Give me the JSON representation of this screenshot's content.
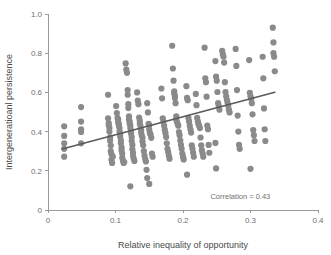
{
  "chart_data": {
    "type": "scatter",
    "title": "",
    "xlabel": "Relative inequality of opportunity",
    "ylabel": "Intergeneratioanl persistence",
    "xlim": [
      0,
      0.4
    ],
    "ylim": [
      0,
      1.0
    ],
    "xticks": [
      0,
      0.1,
      0.2,
      0.3,
      0.4
    ],
    "xtick_labels": [
      "0",
      "0.1",
      "0.2",
      "0.3",
      "0.4"
    ],
    "yticks": [
      0,
      0.2,
      0.4,
      0.6,
      0.8,
      1.0
    ],
    "ytick_labels": [
      "0",
      "0.2",
      "0.4",
      "0.6",
      "0.8",
      "1.0"
    ],
    "grid": false,
    "legend": "none",
    "annotations": [
      {
        "text": "Correlation = 0.43",
        "x": 0.285,
        "y": 0.055
      }
    ],
    "marker_color": "#8a8a8a",
    "marker_size": 3.1,
    "trend_line": {
      "color": "#5a5a5a",
      "x": [
        0.021,
        0.336
      ],
      "y": [
        0.311,
        0.601
      ]
    },
    "points": [
      [
        0.024,
        0.427
      ],
      [
        0.024,
        0.378
      ],
      [
        0.024,
        0.34
      ],
      [
        0.024,
        0.312
      ],
      [
        0.024,
        0.272
      ],
      [
        0.049,
        0.525
      ],
      [
        0.049,
        0.451
      ],
      [
        0.049,
        0.412
      ],
      [
        0.049,
        0.398
      ],
      [
        0.049,
        0.34
      ],
      [
        0.089,
        0.588
      ],
      [
        0.089,
        0.468
      ],
      [
        0.09,
        0.444
      ],
      [
        0.09,
        0.432
      ],
      [
        0.091,
        0.418
      ],
      [
        0.091,
        0.4
      ],
      [
        0.092,
        0.371
      ],
      [
        0.092,
        0.353
      ],
      [
        0.093,
        0.329
      ],
      [
        0.093,
        0.3
      ],
      [
        0.094,
        0.284
      ],
      [
        0.094,
        0.256
      ],
      [
        0.095,
        0.24
      ],
      [
        0.096,
        0.272
      ],
      [
        0.101,
        0.53
      ],
      [
        0.102,
        0.495
      ],
      [
        0.103,
        0.47
      ],
      [
        0.104,
        0.462
      ],
      [
        0.104,
        0.447
      ],
      [
        0.105,
        0.438
      ],
      [
        0.105,
        0.43
      ],
      [
        0.106,
        0.418
      ],
      [
        0.106,
        0.4
      ],
      [
        0.107,
        0.388
      ],
      [
        0.107,
        0.374
      ],
      [
        0.108,
        0.354
      ],
      [
        0.108,
        0.341
      ],
      [
        0.109,
        0.32
      ],
      [
        0.109,
        0.305
      ],
      [
        0.11,
        0.288
      ],
      [
        0.11,
        0.266
      ],
      [
        0.111,
        0.252
      ],
      [
        0.112,
        0.24
      ],
      [
        0.113,
        0.245
      ],
      [
        0.115,
        0.748
      ],
      [
        0.116,
        0.716
      ],
      [
        0.117,
        0.7
      ],
      [
        0.118,
        0.612
      ],
      [
        0.118,
        0.588
      ],
      [
        0.119,
        0.54
      ],
      [
        0.119,
        0.52
      ],
      [
        0.12,
        0.478
      ],
      [
        0.12,
        0.462
      ],
      [
        0.121,
        0.452
      ],
      [
        0.121,
        0.44
      ],
      [
        0.122,
        0.432
      ],
      [
        0.122,
        0.418
      ],
      [
        0.123,
        0.404
      ],
      [
        0.123,
        0.39
      ],
      [
        0.124,
        0.372
      ],
      [
        0.124,
        0.352
      ],
      [
        0.125,
        0.332
      ],
      [
        0.125,
        0.31
      ],
      [
        0.126,
        0.292
      ],
      [
        0.126,
        0.275
      ],
      [
        0.127,
        0.262
      ],
      [
        0.128,
        0.25
      ],
      [
        0.122,
        0.121
      ],
      [
        0.132,
        0.6
      ],
      [
        0.133,
        0.558
      ],
      [
        0.134,
        0.54
      ],
      [
        0.135,
        0.472
      ],
      [
        0.136,
        0.455
      ],
      [
        0.136,
        0.44
      ],
      [
        0.137,
        0.428
      ],
      [
        0.138,
        0.408
      ],
      [
        0.138,
        0.394
      ],
      [
        0.139,
        0.38
      ],
      [
        0.14,
        0.368
      ],
      [
        0.14,
        0.35
      ],
      [
        0.141,
        0.33
      ],
      [
        0.142,
        0.3
      ],
      [
        0.143,
        0.278
      ],
      [
        0.144,
        0.26
      ],
      [
        0.145,
        0.248
      ],
      [
        0.147,
        0.545
      ],
      [
        0.148,
        0.498
      ],
      [
        0.149,
        0.44
      ],
      [
        0.15,
        0.432
      ],
      [
        0.15,
        0.41
      ],
      [
        0.151,
        0.392
      ],
      [
        0.152,
        0.385
      ],
      [
        0.153,
        0.368
      ],
      [
        0.154,
        0.288
      ],
      [
        0.155,
        0.272
      ],
      [
        0.146,
        0.205
      ],
      [
        0.147,
        0.163
      ],
      [
        0.15,
        0.133
      ],
      [
        0.168,
        0.62
      ],
      [
        0.169,
        0.57
      ],
      [
        0.17,
        0.468
      ],
      [
        0.171,
        0.452
      ],
      [
        0.172,
        0.43
      ],
      [
        0.173,
        0.41
      ],
      [
        0.174,
        0.392
      ],
      [
        0.175,
        0.372
      ],
      [
        0.176,
        0.34
      ],
      [
        0.177,
        0.312
      ],
      [
        0.178,
        0.296
      ],
      [
        0.179,
        0.278
      ],
      [
        0.18,
        0.262
      ],
      [
        0.184,
        0.838
      ],
      [
        0.185,
        0.722
      ],
      [
        0.186,
        0.66
      ],
      [
        0.187,
        0.605
      ],
      [
        0.187,
        0.595
      ],
      [
        0.188,
        0.582
      ],
      [
        0.188,
        0.572
      ],
      [
        0.189,
        0.545
      ],
      [
        0.19,
        0.478
      ],
      [
        0.19,
        0.462
      ],
      [
        0.191,
        0.45
      ],
      [
        0.192,
        0.44
      ],
      [
        0.193,
        0.43
      ],
      [
        0.194,
        0.398
      ],
      [
        0.195,
        0.382
      ],
      [
        0.196,
        0.355
      ],
      [
        0.197,
        0.332
      ],
      [
        0.198,
        0.312
      ],
      [
        0.199,
        0.288
      ],
      [
        0.2,
        0.272
      ],
      [
        0.201,
        0.258
      ],
      [
        0.205,
        0.632
      ],
      [
        0.206,
        0.572
      ],
      [
        0.207,
        0.56
      ],
      [
        0.208,
        0.47
      ],
      [
        0.209,
        0.452
      ],
      [
        0.21,
        0.43
      ],
      [
        0.211,
        0.412
      ],
      [
        0.212,
        0.395
      ],
      [
        0.213,
        0.33
      ],
      [
        0.214,
        0.312
      ],
      [
        0.215,
        0.292
      ],
      [
        0.216,
        0.272
      ],
      [
        0.206,
        0.18
      ],
      [
        0.219,
        0.592
      ],
      [
        0.22,
        0.535
      ],
      [
        0.221,
        0.47
      ],
      [
        0.222,
        0.452
      ],
      [
        0.223,
        0.438
      ],
      [
        0.224,
        0.428
      ],
      [
        0.225,
        0.418
      ],
      [
        0.226,
        0.37
      ],
      [
        0.227,
        0.33
      ],
      [
        0.228,
        0.305
      ],
      [
        0.229,
        0.288
      ],
      [
        0.23,
        0.272
      ],
      [
        0.232,
        0.828
      ],
      [
        0.233,
        0.672
      ],
      [
        0.234,
        0.652
      ],
      [
        0.235,
        0.578
      ],
      [
        0.236,
        0.43
      ],
      [
        0.237,
        0.412
      ],
      [
        0.238,
        0.332
      ],
      [
        0.239,
        0.292
      ],
      [
        0.248,
        0.76
      ],
      [
        0.249,
        0.68
      ],
      [
        0.25,
        0.66
      ],
      [
        0.251,
        0.602
      ],
      [
        0.252,
        0.545
      ],
      [
        0.253,
        0.53
      ],
      [
        0.254,
        0.512
      ],
      [
        0.248,
        0.342
      ],
      [
        0.249,
        0.212
      ],
      [
        0.258,
        0.812
      ],
      [
        0.259,
        0.795
      ],
      [
        0.26,
        0.782
      ],
      [
        0.261,
        0.752
      ],
      [
        0.262,
        0.652
      ],
      [
        0.263,
        0.602
      ],
      [
        0.264,
        0.58
      ],
      [
        0.265,
        0.562
      ],
      [
        0.266,
        0.548
      ],
      [
        0.267,
        0.532
      ],
      [
        0.268,
        0.512
      ],
      [
        0.269,
        0.498
      ],
      [
        0.278,
        0.822
      ],
      [
        0.279,
        0.735
      ],
      [
        0.28,
        0.612
      ],
      [
        0.281,
        0.482
      ],
      [
        0.282,
        0.4
      ],
      [
        0.283,
        0.332
      ],
      [
        0.284,
        0.312
      ],
      [
        0.298,
        0.765
      ],
      [
        0.299,
        0.598
      ],
      [
        0.3,
        0.58
      ],
      [
        0.301,
        0.568
      ],
      [
        0.302,
        0.545
      ],
      [
        0.303,
        0.488
      ],
      [
        0.304,
        0.408
      ],
      [
        0.305,
        0.382
      ],
      [
        0.306,
        0.352
      ],
      [
        0.3,
        0.21
      ],
      [
        0.318,
        0.782
      ],
      [
        0.319,
        0.672
      ],
      [
        0.32,
        0.518
      ],
      [
        0.321,
        0.412
      ],
      [
        0.322,
        0.352
      ],
      [
        0.333,
        0.93
      ],
      [
        0.334,
        0.855
      ],
      [
        0.334,
        0.8
      ],
      [
        0.335,
        0.782
      ],
      [
        0.336,
        0.708
      ]
    ]
  }
}
